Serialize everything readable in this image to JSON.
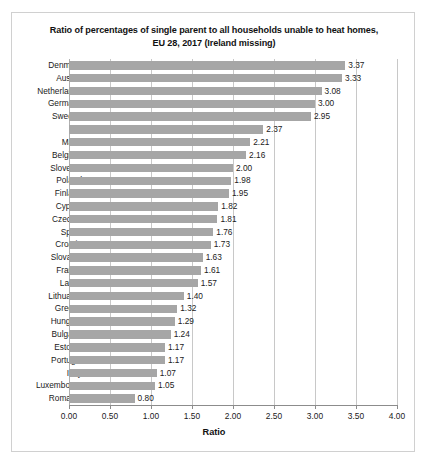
{
  "chart_data": {
    "type": "bar",
    "orientation": "horizontal",
    "title": "Ratio of percentages of single parent to all households unable to heat homes, EU 28, 2017 (Ireland missing)",
    "title_lines": [
      "Ratio of percentages of single parent to all households unable to heat homes,",
      "EU 28, 2017 (Ireland missing)"
    ],
    "xlabel": "Ratio",
    "ylabel": "",
    "xlim": [
      0.0,
      4.0
    ],
    "xticks": [
      "0.00",
      "0.50",
      "1.00",
      "1.50",
      "2.00",
      "2.50",
      "3.00",
      "3.50",
      "4.00"
    ],
    "xtick_values": [
      0.0,
      0.5,
      1.0,
      1.5,
      2.0,
      2.5,
      3.0,
      3.5,
      4.0
    ],
    "grid": "vertical",
    "legend": "none",
    "bar_color": "#a6a6a6",
    "grid_color": "#c8c8c8",
    "categories": [
      "Denmark",
      "Austria",
      "Netherlands",
      "Germany",
      "Sweden",
      "UK",
      "Malta",
      "Belgium",
      "Slovenia",
      "Poland",
      "Finland",
      "Cyprus",
      "Czechia",
      "Spain",
      "Croatia",
      "Slovakia",
      "France",
      "Latvia",
      "Lithuania",
      "Greece",
      "Hungary",
      "Bulgaria",
      "Estonia",
      "Portugal",
      "Italy",
      "Luxembourg",
      "Romania"
    ],
    "values": [
      3.37,
      3.33,
      3.08,
      3.0,
      2.95,
      2.37,
      2.21,
      2.16,
      2.0,
      1.98,
      1.95,
      1.82,
      1.81,
      1.76,
      1.73,
      1.63,
      1.61,
      1.57,
      1.4,
      1.32,
      1.29,
      1.24,
      1.17,
      1.17,
      1.07,
      1.05,
      0.8
    ],
    "data_labels": [
      "3.37",
      "3.33",
      "3.08",
      "3.00",
      "2.95",
      "2.37",
      "2.21",
      "2.16",
      "2.00",
      "1.98",
      "1.95",
      "1.82",
      "1.81",
      "1.76",
      "1.73",
      "1.63",
      "1.61",
      "1.57",
      "1.40",
      "1.32",
      "1.29",
      "1.24",
      "1.17",
      "1.17",
      "1.07",
      "1.05",
      "0.80"
    ]
  }
}
